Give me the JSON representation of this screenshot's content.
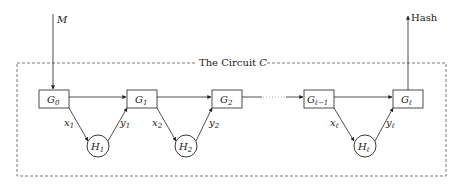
{
  "diagram": {
    "title": "The Circuit",
    "title_symbol": "C",
    "input_label": "M",
    "output_label": "Hash",
    "gates": [
      {
        "id": "G0",
        "base": "G",
        "sub": "0"
      },
      {
        "id": "G1",
        "base": "G",
        "sub": "1"
      },
      {
        "id": "G2",
        "base": "G",
        "sub": "2"
      },
      {
        "id": "Gl-1",
        "base": "G",
        "sub": "ℓ−1"
      },
      {
        "id": "Gl",
        "base": "G",
        "sub": "ℓ"
      }
    ],
    "hash_nodes": [
      {
        "id": "H1",
        "base": "H",
        "sub": "1",
        "in_label": "x",
        "in_sub": "1",
        "out_label": "y",
        "out_sub": "1"
      },
      {
        "id": "H2",
        "base": "H",
        "sub": "2",
        "in_label": "x",
        "in_sub": "2",
        "out_label": "y",
        "out_sub": "2"
      },
      {
        "id": "Hl",
        "base": "H",
        "sub": "ℓ",
        "in_label": "x",
        "in_sub": "ℓ",
        "out_label": "y",
        "out_sub": "ℓ"
      }
    ],
    "colors": {
      "stroke": "#222222",
      "dashed": "#555555",
      "background": "#ffffff"
    }
  }
}
